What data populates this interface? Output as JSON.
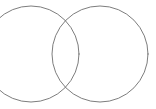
{
  "canvas": {
    "width": 156,
    "height": 109,
    "background_color": "#ffffff",
    "description": "Two overlapping outlined circles (two-circle Venn / vesica piscis figure) on a plain white background. The left circle is clipped by the left edge of the image."
  },
  "style": {
    "stroke_color": "#6e6e6e",
    "stroke_color_alt": "#808080",
    "stroke_width": 0.9,
    "fill": "none",
    "line_cap": "round"
  },
  "chart_data": {
    "type": "diagram",
    "subtype": "venn-two-circle",
    "title": "",
    "xlabel": "",
    "ylabel": "",
    "grid": false,
    "legend": false,
    "axis_ranges": {
      "x": [
        0,
        156
      ],
      "y": [
        0,
        109
      ]
    },
    "shapes": [
      {
        "name": "left-circle",
        "type": "circle",
        "cx": 31,
        "cy": 54,
        "r": 48,
        "clipped_edges": [
          "left"
        ],
        "extent": {
          "left": -17,
          "right": 79,
          "top": 6,
          "bottom": 102
        }
      },
      {
        "name": "right-circle",
        "type": "circle",
        "cx": 100,
        "cy": 54,
        "r": 48,
        "clipped_edges": [],
        "extent": {
          "left": 52,
          "right": 148,
          "top": 6,
          "bottom": 102
        }
      }
    ],
    "intersections": [
      {
        "name": "upper-intersection",
        "x": 68,
        "y": 23
      },
      {
        "name": "lower-intersection",
        "x": 68,
        "y": 86
      }
    ],
    "center_distance": 69,
    "overlap_width": 27
  },
  "labels": {
    "left_circle_label": "",
    "right_circle_label": "",
    "intersection_label": "",
    "caption": ""
  }
}
